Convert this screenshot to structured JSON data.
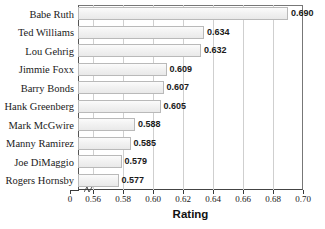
{
  "chart_data": {
    "type": "bar",
    "orientation": "horizontal",
    "title": "",
    "xlabel": "Rating",
    "ylabel": "",
    "xlim": [
      0.55,
      0.7
    ],
    "axis_break": true,
    "grid": "vertical",
    "legend": "none",
    "zero_tick_label": "0",
    "xticks": [
      0.56,
      0.58,
      0.6,
      0.62,
      0.64,
      0.66,
      0.68,
      0.7
    ],
    "xtick_labels": [
      "0.56",
      "0.58",
      "0.60",
      "0.62",
      "0.64",
      "0.66",
      "0.68",
      "0.70"
    ],
    "categories": [
      "Babe Ruth",
      "Ted Williams",
      "Lou Gehrig",
      "Jimmie Foxx",
      "Barry Bonds",
      "Hank Greenberg",
      "Mark McGwire",
      "Manny Ramirez",
      "Joe DiMaggio",
      "Rogers Hornsby"
    ],
    "values": [
      0.69,
      0.634,
      0.632,
      0.609,
      0.607,
      0.605,
      0.588,
      0.585,
      0.579,
      0.577
    ],
    "value_labels": [
      "0.690",
      "0.634",
      "0.632",
      "0.609",
      "0.607",
      "0.605",
      "0.588",
      "0.585",
      "0.579",
      "0.577"
    ],
    "colors": {
      "bar_fill": "#f2f2f2",
      "bar_border": "#b9b9b9",
      "gridline": "#cfcfcf",
      "axis": "#3a3a3a",
      "text": "#1a1a1a"
    }
  }
}
